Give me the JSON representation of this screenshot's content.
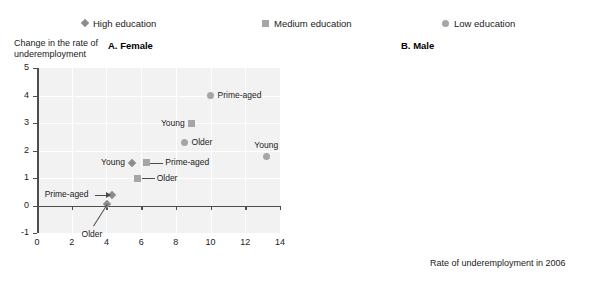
{
  "legend": {
    "items": [
      {
        "label": "High education",
        "marker": "diamond-marker-icon",
        "color": "#8c8c8c"
      },
      {
        "label": "Medium education",
        "marker": "square-marker-icon",
        "color": "#a6a6a6"
      },
      {
        "label": "Low education",
        "marker": "circle-marker-icon",
        "color": "#a6a6a6"
      }
    ]
  },
  "axis_titles": {
    "y": "Change in the rate of\nunderemployment",
    "x": "Rate of underemployment in 2006"
  },
  "panels": {
    "female": {
      "title": "A. Female",
      "y_ticks": [
        "5",
        "4",
        "3",
        "2",
        "1",
        "0",
        "-1"
      ],
      "x_ticks": [
        "0",
        "2",
        "4",
        "6",
        "8",
        "10",
        "12",
        "14"
      ]
    },
    "male": {
      "title": "B. Male",
      "y_ticks": [
        "5",
        "4",
        "3",
        "2",
        "1",
        "0",
        "-1"
      ],
      "x_ticks": [
        "0",
        "1",
        "2",
        "3",
        "4",
        "5",
        "6"
      ]
    }
  },
  "chart_data": [
    {
      "type": "scatter",
      "title": "A. Female",
      "xlabel": "Rate of underemployment in 2006",
      "ylabel": "Change in the rate of underemployment",
      "xlim": [
        0,
        14
      ],
      "ylim": [
        -1,
        5
      ],
      "grid": true,
      "legend_position": "top",
      "series": [
        {
          "name": "High education",
          "marker": "diamond",
          "color": "#8c8c8c",
          "points": [
            {
              "label": "Young",
              "x": 5.45,
              "y": 1.55,
              "label_side": "left"
            },
            {
              "label": "Prime-aged",
              "x": 4.3,
              "y": 0.4,
              "label_side": "left-arrow"
            },
            {
              "label": "Older",
              "x": 4.05,
              "y": 0.05,
              "label_side": "below-leader"
            }
          ]
        },
        {
          "name": "Medium education",
          "marker": "square",
          "color": "#a6a6a6",
          "points": [
            {
              "label": "Young",
              "x": 8.9,
              "y": 3.0,
              "label_side": "left"
            },
            {
              "label": "Prime-aged",
              "x": 6.3,
              "y": 1.55,
              "label_side": "right-leader"
            },
            {
              "label": "Older",
              "x": 5.8,
              "y": 1.0,
              "label_side": "right-leader"
            }
          ]
        },
        {
          "name": "Low education",
          "marker": "circle",
          "color": "#a6a6a6",
          "points": [
            {
              "label": "Prime-aged",
              "x": 10.0,
              "y": 4.0,
              "label_side": "right"
            },
            {
              "label": "Older",
              "x": 8.5,
              "y": 2.3,
              "label_side": "right"
            },
            {
              "label": "Young",
              "x": 13.2,
              "y": 1.8,
              "label_side": "above"
            }
          ]
        }
      ]
    },
    {
      "type": "scatter",
      "title": "B. Male",
      "xlabel": "Rate of underemployment in 2006",
      "ylabel": "Change in the rate of underemployment",
      "xlim": [
        0,
        6
      ],
      "ylim": [
        -1,
        5
      ],
      "grid": true,
      "legend_position": "top",
      "series": [
        {
          "name": "High education",
          "marker": "diamond",
          "color": "#8c8c8c",
          "points": [
            {
              "label": "Young",
              "x": 2.8,
              "y": 1.25,
              "label_side": "right"
            },
            {
              "label": "Prime-aged",
              "x": 1.35,
              "y": 0.35,
              "label_side": "left"
            },
            {
              "label": "Older",
              "x": 2.0,
              "y": 0.18,
              "label_side": "right"
            }
          ]
        },
        {
          "name": "Medium education",
          "marker": "square",
          "color": "#a6a6a6",
          "points": [
            {
              "label": "Young",
              "x": 2.75,
              "y": 3.0,
              "label_side": "right"
            },
            {
              "label": "Prime-aged",
              "x": 1.38,
              "y": 1.05,
              "label_side": "left-arrow"
            },
            {
              "label": "Older",
              "x": 2.0,
              "y": 0.72,
              "label_side": "right"
            }
          ]
        },
        {
          "name": "Low education",
          "marker": "circle",
          "color": "#a6a6a6",
          "points": [
            {
              "label": "Young",
              "x": 5.3,
              "y": 4.2,
              "label_side": "left"
            },
            {
              "label": "Prime-aged",
              "x": 2.62,
              "y": 2.38,
              "label_side": "left"
            },
            {
              "label": "Older",
              "x": 2.78,
              "y": 2.18,
              "label_side": "right"
            }
          ]
        }
      ]
    }
  ]
}
